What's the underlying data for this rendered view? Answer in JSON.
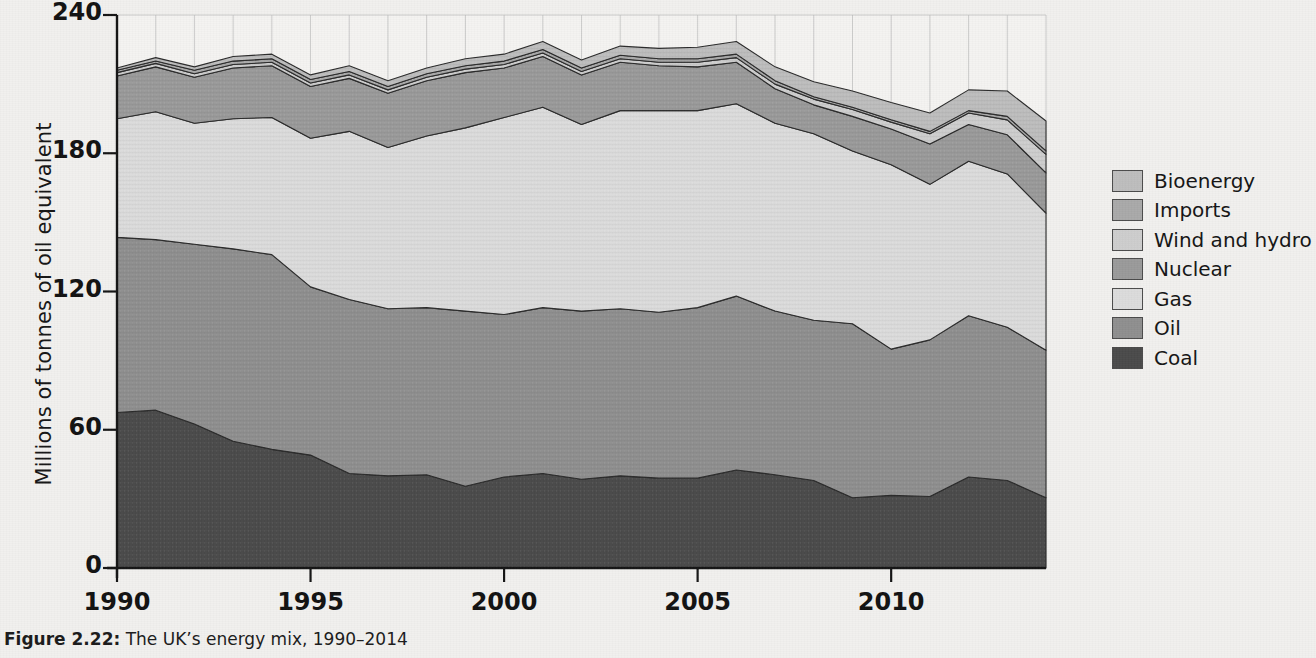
{
  "figure": {
    "caption_label": "Figure 2.22:",
    "caption_text": " The UK’s energy mix, 1990–2014"
  },
  "axes": {
    "y_title": "Millions of tonnes of oil equivalent",
    "y_ticks": [
      0,
      60,
      120,
      180,
      240
    ],
    "x_ticks": [
      1990,
      1995,
      2000,
      2005,
      2010
    ]
  },
  "legend": {
    "position": "right",
    "items": [
      {
        "label": "Bioenergy",
        "color": "#bdbdbd"
      },
      {
        "label": "Imports",
        "color": "#a9a9a9"
      },
      {
        "label": "Wind and hydro",
        "color": "#cdcdcd"
      },
      {
        "label": "Nuclear",
        "color": "#9a9a9a"
      },
      {
        "label": "Gas",
        "color": "#dcdcdc"
      },
      {
        "label": "Oil",
        "color": "#8f8f8f"
      },
      {
        "label": "Coal",
        "color": "#4a4a4a"
      }
    ]
  },
  "chart_data": {
    "type": "area",
    "stacked": true,
    "title": "The UK’s energy mix, 1990–2014",
    "xlabel": "",
    "ylabel": "Millions of tonnes of oil equivalent",
    "ylim": [
      0,
      240
    ],
    "xlim": [
      1990,
      2014
    ],
    "grid": true,
    "x": [
      1990,
      1991,
      1992,
      1993,
      1994,
      1995,
      1996,
      1997,
      1998,
      1999,
      2000,
      2001,
      2002,
      2003,
      2004,
      2005,
      2006,
      2007,
      2008,
      2009,
      2010,
      2011,
      2012,
      2013,
      2014
    ],
    "series": [
      {
        "name": "Coal",
        "values": [
          67.5,
          68.5,
          62.5,
          55.0,
          51.5,
          49.0,
          41.0,
          40.0,
          40.5,
          35.5,
          39.5,
          41.0,
          38.5,
          40.0,
          39.0,
          39.0,
          42.5,
          40.5,
          38.0,
          30.5,
          31.5,
          31.0,
          39.5,
          38.0,
          30.5
        ]
      },
      {
        "name": "Oil",
        "values": [
          76.0,
          74.0,
          78.0,
          83.5,
          84.5,
          73.0,
          75.5,
          72.5,
          72.5,
          76.0,
          70.5,
          72.0,
          73.0,
          72.5,
          72.0,
          74.0,
          75.5,
          71.0,
          69.5,
          75.5,
          63.5,
          68.0,
          70.0,
          66.5,
          64.0
        ]
      },
      {
        "name": "Gas",
        "values": [
          51.5,
          55.5,
          52.5,
          56.5,
          59.5,
          64.5,
          73.0,
          70.0,
          74.5,
          79.5,
          85.5,
          87.0,
          81.0,
          86.0,
          87.5,
          85.5,
          83.5,
          81.5,
          81.0,
          75.0,
          80.0,
          67.5,
          67.0,
          66.5,
          59.5
        ]
      },
      {
        "name": "Nuclear",
        "values": [
          18.5,
          19.5,
          20.0,
          22.0,
          22.5,
          22.5,
          23.0,
          23.5,
          24.0,
          24.0,
          21.5,
          22.0,
          21.5,
          21.0,
          19.5,
          19.0,
          18.0,
          15.0,
          12.5,
          15.0,
          15.5,
          17.5,
          16.0,
          17.0,
          17.5
        ]
      },
      {
        "name": "Wind and hydro",
        "values": [
          1.5,
          1.5,
          1.5,
          1.5,
          1.5,
          1.5,
          1.5,
          1.5,
          1.5,
          1.5,
          1.5,
          1.5,
          1.5,
          1.5,
          1.5,
          2.0,
          2.0,
          2.0,
          2.5,
          3.0,
          3.0,
          4.5,
          5.0,
          6.5,
          8.0
        ]
      },
      {
        "name": "Imports",
        "values": [
          1.0,
          1.0,
          1.5,
          1.5,
          1.5,
          1.5,
          1.5,
          1.5,
          1.5,
          1.5,
          1.5,
          1.5,
          1.5,
          1.5,
          1.5,
          1.5,
          1.5,
          1.5,
          1.0,
          1.0,
          1.0,
          1.0,
          1.0,
          1.5,
          1.5
        ]
      },
      {
        "name": "Bioenergy",
        "values": [
          1.0,
          1.5,
          1.5,
          2.0,
          2.0,
          2.0,
          2.5,
          2.5,
          2.5,
          3.0,
          3.0,
          3.5,
          3.5,
          4.0,
          4.5,
          5.0,
          5.5,
          6.0,
          6.5,
          7.0,
          7.5,
          8.0,
          9.0,
          11.0,
          13.0
        ]
      }
    ]
  },
  "style": {
    "background": "#f1f0ee",
    "axis_color": "#141414",
    "grid_color": "#b9b9b9"
  }
}
